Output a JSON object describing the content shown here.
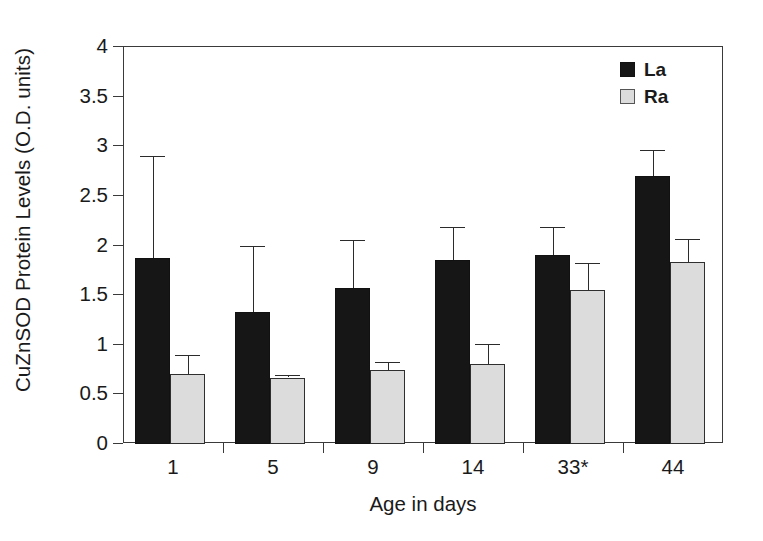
{
  "chart_data": {
    "type": "bar",
    "title": "",
    "xlabel": "Age in days",
    "ylabel": "CuZnSOD Protein Levels (O.D. units)",
    "categories": [
      "1",
      "5",
      "9",
      "14",
      "33*",
      "44"
    ],
    "ylim": [
      0,
      4
    ],
    "ytick_labels": [
      "0",
      "0.5",
      "1",
      "1.5",
      "2",
      "2.5",
      "3",
      "3.5",
      "4"
    ],
    "ytick_values": [
      0,
      0.5,
      1,
      1.5,
      2,
      2.5,
      3,
      3.5,
      4
    ],
    "grid": false,
    "legend_position": "top-right",
    "series": [
      {
        "name": "La",
        "color": "#161616",
        "values": [
          1.87,
          1.33,
          1.57,
          1.85,
          1.9,
          2.7
        ],
        "error_upper": [
          2.9,
          1.99,
          2.06,
          2.19,
          2.19,
          2.96
        ]
      },
      {
        "name": "Ra",
        "color": "#dcdcdc",
        "values": [
          0.71,
          0.67,
          0.75,
          0.81,
          1.55,
          1.83
        ],
        "error_upper": [
          0.9,
          0.7,
          0.83,
          1.01,
          1.82,
          2.07
        ]
      }
    ],
    "annotations": [
      "* indicates group label 33*"
    ]
  },
  "legend": {
    "items": [
      {
        "label": "La",
        "swatch": "black-square"
      },
      {
        "label": "Ra",
        "swatch": "light-gray-square"
      }
    ]
  },
  "axes": {
    "x_title": "Age in days",
    "y_title": "CuZnSOD Protein Levels (O.D. units)"
  }
}
